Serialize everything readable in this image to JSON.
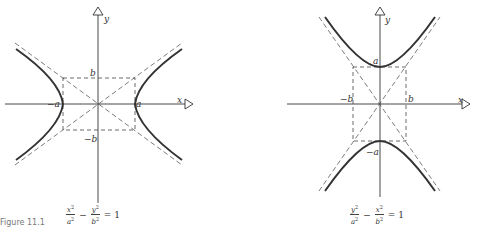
{
  "figures": [
    {
      "id": "horizontal-hyperbola",
      "axis_labels": {
        "x": "x",
        "y": "y"
      },
      "vertex_labels": {
        "left": "−a",
        "right": "a"
      },
      "box_labels": {
        "top": "b",
        "bottom": "−b"
      },
      "equation": {
        "term1_num": "x",
        "term1_den": "a",
        "operator": "−",
        "term2_num": "y",
        "term2_den": "b",
        "power": "2",
        "rhs": "= 1"
      }
    },
    {
      "id": "vertical-hyperbola",
      "axis_labels": {
        "x": "x",
        "y": "y"
      },
      "vertex_labels": {
        "top": "a",
        "bottom": "−a"
      },
      "box_labels": {
        "left": "−b",
        "right": "b"
      },
      "equation": {
        "term1_num": "y",
        "term1_den": "a",
        "operator": "−",
        "term2_num": "x",
        "term2_den": "b",
        "power": "2",
        "rhs": "= 1"
      }
    }
  ],
  "caption": "Figure 11.1"
}
